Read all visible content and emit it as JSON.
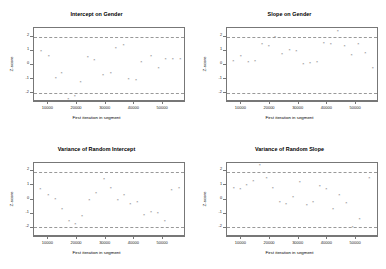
{
  "figure": {
    "title": "",
    "layout": "2x2 grid of Geweke diagnostic scatter plots",
    "background_color": "#ffffff",
    "point_color": "#606060",
    "axis_color": "#777777",
    "reference_line_color": "#999999"
  },
  "chart_data": [
    {
      "type": "scatter",
      "title": "Intercept on Gender",
      "xlabel": "First iteration in segment",
      "ylabel": "Z-score",
      "xlim": [
        5000,
        58000
      ],
      "ylim": [
        -2.6,
        2.6
      ],
      "xticks": [
        10000,
        20000,
        30000,
        40000,
        50000
      ],
      "xtick_labels": [
        "10000",
        "20000",
        "30000",
        "40000",
        "50000"
      ],
      "yticks": [
        2,
        1,
        0,
        -1,
        -2
      ],
      "ytick_labels": [
        "2",
        "1",
        "0",
        "-1",
        "-2"
      ],
      "grid": false,
      "legend": "none",
      "reference_lines": [
        1.96,
        -1.96
      ],
      "x": [
        7500,
        10200,
        12600,
        14600,
        17000,
        19200,
        21200,
        23800,
        26000,
        29100,
        31800,
        33500,
        36200,
        38000,
        40600,
        42400,
        45800,
        48400,
        50900,
        53400,
        56000
      ],
      "y": [
        0.95,
        0.62,
        -0.95,
        -0.62,
        -2.45,
        -2.2,
        -1.25,
        0.52,
        0.35,
        -0.72,
        -0.62,
        1.15,
        1.38,
        -1.02,
        -1.08,
        0.18,
        0.62,
        -0.25,
        0.42,
        0.42,
        0.42
      ]
    },
    {
      "type": "scatter",
      "title": "Slope on Gender",
      "xlabel": "First iteration in segment",
      "ylabel": "Z-score",
      "xlim": [
        5000,
        58000
      ],
      "ylim": [
        -2.6,
        2.6
      ],
      "xticks": [
        10000,
        20000,
        30000,
        40000,
        50000
      ],
      "xtick_labels": [
        "10000",
        "20000",
        "30000",
        "40000",
        "50000"
      ],
      "yticks": [
        2,
        1,
        0,
        -1,
        -2
      ],
      "ytick_labels": [
        "2",
        "1",
        "0",
        "-1",
        "-2"
      ],
      "grid": false,
      "legend": "none",
      "reference_lines": [
        1.96,
        -1.96
      ],
      "x": [
        7200,
        9800,
        12400,
        14800,
        17200,
        19600,
        21800,
        24200,
        26800,
        29200,
        31600,
        34000,
        36400,
        38800,
        41200,
        43600,
        46000,
        48400,
        50800,
        53200,
        55800
      ],
      "y": [
        0.25,
        0.62,
        0.15,
        0.28,
        1.42,
        1.28,
        1.96,
        0.72,
        1.05,
        0.95,
        0.02,
        0.12,
        0.18,
        1.52,
        1.42,
        2.35,
        1.32,
        0.68,
        1.45,
        0.78,
        -0.22
      ]
    },
    {
      "type": "scatter",
      "title": "Variance of Random Intercept",
      "xlabel": "First iteration in segment",
      "ylabel": "Z-score",
      "xlim": [
        5000,
        58000
      ],
      "ylim": [
        -2.6,
        2.6
      ],
      "xticks": [
        10000,
        20000,
        30000,
        40000,
        50000
      ],
      "xtick_labels": [
        "10000",
        "20000",
        "30000",
        "40000",
        "50000"
      ],
      "yticks": [
        2,
        1,
        0,
        -1,
        -2
      ],
      "ytick_labels": [
        "2",
        "1",
        "0",
        "-1",
        "-2"
      ],
      "grid": false,
      "legend": "none",
      "reference_lines": [
        1.96,
        -1.96
      ],
      "x": [
        7200,
        10000,
        12400,
        14800,
        17200,
        19400,
        21800,
        24300,
        26600,
        29400,
        31800,
        34200,
        36400,
        38600,
        41000,
        43400,
        45800,
        48200,
        50600,
        53000,
        55600
      ],
      "y": [
        0.72,
        0.28,
        0.02,
        -0.68,
        -1.52,
        -1.75,
        -1.22,
        -0.08,
        0.42,
        1.38,
        0.78,
        -0.08,
        0.28,
        -0.38,
        -0.22,
        -1.12,
        -0.88,
        -0.95,
        -1.55,
        0.62,
        0.78
      ]
    },
    {
      "type": "scatter",
      "title": "Variance of Random Slope",
      "xlabel": "First iteration in segment",
      "ylabel": "Z-score",
      "xlim": [
        5000,
        58000
      ],
      "ylim": [
        -2.6,
        2.6
      ],
      "xticks": [
        10000,
        20000,
        30000,
        40000,
        50000
      ],
      "xtick_labels": [
        "10000",
        "20000",
        "30000",
        "40000",
        "50000"
      ],
      "yticks": [
        2,
        1,
        0,
        -1,
        -2
      ],
      "ytick_labels": [
        "2",
        "1",
        "0",
        "-1",
        "-2"
      ],
      "grid": false,
      "legend": "none",
      "reference_lines": [
        1.96,
        -1.96
      ],
      "x": [
        7400,
        9600,
        11800,
        14200,
        16400,
        18800,
        21000,
        23400,
        25600,
        28000,
        30400,
        32800,
        35000,
        37400,
        39600,
        42000,
        44200,
        46600,
        48800,
        51200,
        54600
      ],
      "y": [
        0.78,
        0.68,
        0.95,
        1.28,
        2.38,
        1.45,
        0.78,
        -0.18,
        -0.35,
        0.12,
        1.18,
        -0.42,
        -0.18,
        0.88,
        0.72,
        -0.68,
        0.25,
        -0.25,
        -1.96,
        -1.38,
        1.45
      ]
    }
  ]
}
